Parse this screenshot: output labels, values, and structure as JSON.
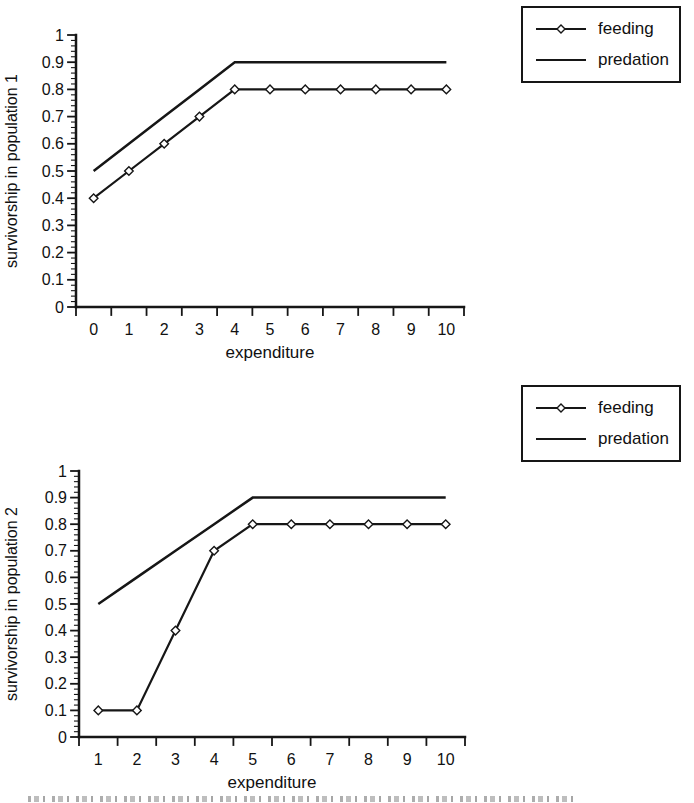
{
  "page": {
    "background": "#ffffff",
    "ink_color": "#161616",
    "text_color": "#111111"
  },
  "chart_data": [
    {
      "type": "line",
      "title": "",
      "xlabel": "expenditure",
      "ylabel": "survivorship in population 1",
      "x": [
        0,
        1,
        2,
        3,
        4,
        5,
        6,
        7,
        8,
        9,
        10
      ],
      "series": [
        {
          "name": "feeding",
          "marker": "open-diamond",
          "values": [
            0.4,
            0.5,
            0.6,
            0.7,
            0.8,
            0.8,
            0.8,
            0.8,
            0.8,
            0.8,
            0.8
          ]
        },
        {
          "name": "predation",
          "marker": "none",
          "values": [
            0.5,
            0.6,
            0.7,
            0.8,
            0.9,
            0.9,
            0.9,
            0.9,
            0.9,
            0.9,
            0.9
          ]
        }
      ],
      "ylim": [
        0,
        1
      ],
      "y_major_step": 0.1,
      "y_minor_step": 0.02,
      "y_tick_labels": [
        "0",
        "0.1",
        "0.2",
        "0.3",
        "0.4",
        "0.5",
        "0.6",
        "0.7",
        "0.8",
        "0.9",
        "1"
      ],
      "grid": false,
      "legend_position": "outside-top-right"
    },
    {
      "type": "line",
      "title": "",
      "xlabel": "expenditure",
      "ylabel": "survivorship in population 2",
      "x": [
        1,
        2,
        3,
        4,
        5,
        6,
        7,
        8,
        9,
        10
      ],
      "series": [
        {
          "name": "feeding",
          "marker": "open-diamond",
          "values": [
            0.1,
            0.1,
            0.4,
            0.7,
            0.8,
            0.8,
            0.8,
            0.8,
            0.8,
            0.8
          ]
        },
        {
          "name": "predation",
          "marker": "none",
          "values": [
            0.5,
            0.6,
            0.7,
            0.8,
            0.9,
            0.9,
            0.9,
            0.9,
            0.9,
            0.9
          ]
        }
      ],
      "ylim": [
        0,
        1
      ],
      "y_major_step": 0.1,
      "y_minor_step": 0.02,
      "y_tick_labels": [
        "0",
        "0.1",
        "0.2",
        "0.3",
        "0.4",
        "0.5",
        "0.6",
        "0.7",
        "0.8",
        "0.9",
        "1"
      ],
      "grid": false,
      "legend_position": "outside-top-right"
    }
  ]
}
